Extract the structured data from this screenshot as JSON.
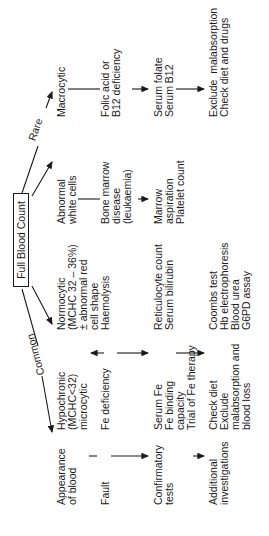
{
  "root": {
    "label": "Full Blood Count"
  },
  "branches": {
    "common": "Common",
    "rare": "Rare"
  },
  "row_labels": {
    "appearance": "Appearance\nof blood",
    "fault": "Fault",
    "confirmatory": "Confirmatory\ntests",
    "additional": "Additional\ninvestigations"
  },
  "columns": [
    {
      "appearance": "Hypochronic\n(MCHC<32)\nmicrocytic",
      "fault": "Fe deficiency",
      "confirmatory": "Serum Fe\nFe binding\ncapacity\nTrial of Fe therapy",
      "additional": "Check diet\nExclude\nmalabsorption and\nblood loss"
    },
    {
      "appearance": "Normocytic\n(MCHC 32 – 36%)\n± abnormal red\ncell shape",
      "fault": "Haemolysis",
      "confirmatory": "Reticulocyte count\nSerum bilirubin",
      "additional": "Coombs test\nHb electrophoresis\nBlood urea\nG6PD assay"
    },
    {
      "appearance": "Abnormal\nwhite cells",
      "fault": "Bone marrow\ndisease\n(leukaemia)",
      "confirmatory": "Marrow\naspiration\nPlatelet count",
      "additional": ""
    },
    {
      "appearance": "Macrocytic",
      "fault": "Folic acid or\nB12 deficiency",
      "confirmatory": "Serum folate\nSerum B12",
      "additional": "Exclude  malabsorption\nCheck diet and drugs"
    }
  ]
}
